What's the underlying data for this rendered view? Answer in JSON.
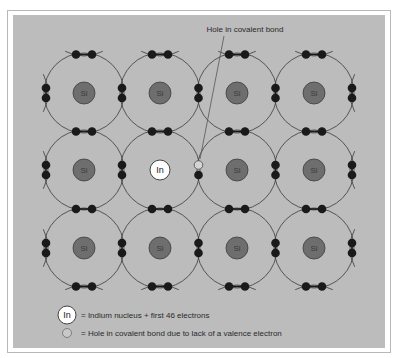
{
  "diagram": {
    "annotation": "Hole in covalent bond",
    "grid": {
      "columns_x": [
        84,
        160,
        237,
        314
      ],
      "rows_y": [
        93,
        170,
        248
      ],
      "orbit_radius": 40
    },
    "atoms": [
      [
        "Si",
        "Si",
        "Si",
        "Si"
      ],
      [
        "Si",
        "In",
        "Si",
        "Si"
      ],
      [
        "Si",
        "Si",
        "Si",
        "Si"
      ]
    ],
    "impurity": {
      "symbol": "In",
      "row": 1,
      "col": 1
    },
    "hole": {
      "x": 199,
      "y": 163
    },
    "colors": {
      "panel": "#bcbcbc",
      "nucleus_fill": "#6e6e6e",
      "nucleus_stroke": "#3c3c3c",
      "electron": "#1a1a1a",
      "orbit": "#3a3a3a",
      "impurity_fill": "#ffffff"
    }
  },
  "legend": {
    "items": [
      {
        "symbol": "In",
        "text": "= Indium nucleus + first 46 electrons"
      },
      {
        "symbol": "hole",
        "text": "= Hole in covalent bond due to lack of a valence electron"
      }
    ]
  }
}
